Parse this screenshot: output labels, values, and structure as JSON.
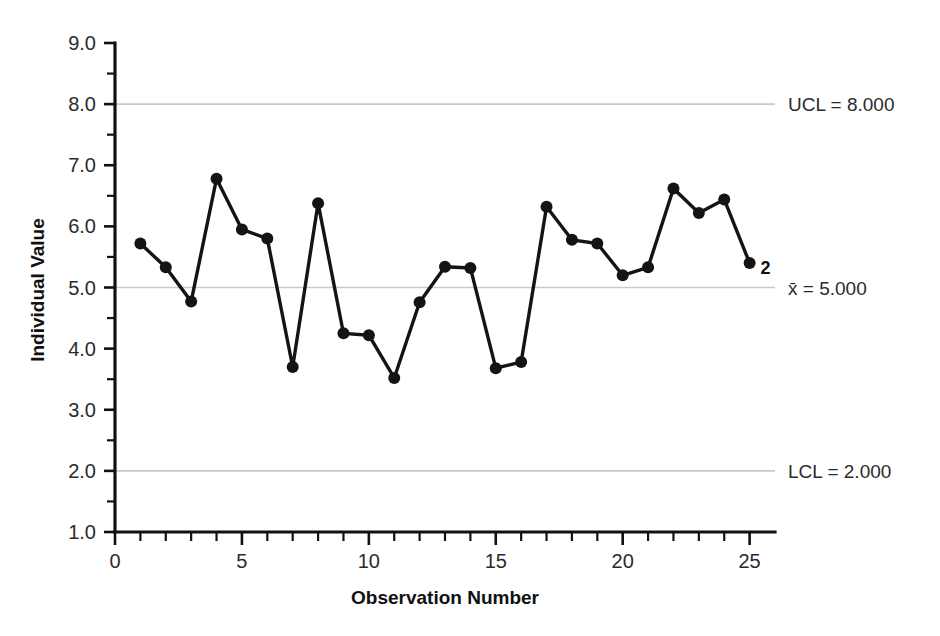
{
  "chart_data": {
    "type": "line",
    "title": "",
    "xlabel": "Observation Number",
    "ylabel": "Individual Value",
    "xlim": [
      0,
      26
    ],
    "ylim": [
      1.0,
      9.0
    ],
    "grid": true,
    "legend_position": "none",
    "x": [
      1,
      2,
      3,
      4,
      5,
      6,
      7,
      8,
      9,
      10,
      11,
      12,
      13,
      14,
      15,
      16,
      17,
      18,
      19,
      20,
      21,
      22,
      23,
      24,
      25
    ],
    "values": [
      5.72,
      5.33,
      4.77,
      6.78,
      5.95,
      5.8,
      3.7,
      6.38,
      4.25,
      4.22,
      3.52,
      4.76,
      5.34,
      5.32,
      3.68,
      3.78,
      6.32,
      5.78,
      5.72,
      5.2,
      5.33,
      6.62,
      6.22,
      6.44,
      5.4
    ],
    "series": [
      {
        "name": "Individual Value",
        "values": [
          5.72,
          5.33,
          4.77,
          6.78,
          5.95,
          5.8,
          3.7,
          6.38,
          4.25,
          4.22,
          3.52,
          4.76,
          5.34,
          5.32,
          3.68,
          3.78,
          6.32,
          5.78,
          5.72,
          5.2,
          5.33,
          6.62,
          6.22,
          6.44,
          5.4
        ]
      }
    ],
    "xticks": [
      0,
      5,
      10,
      15,
      20,
      25
    ],
    "xtick_labels": [
      "0",
      "5",
      "10",
      "15",
      "20",
      "25"
    ],
    "xtick_minor_step": 1,
    "yticks": [
      1.0,
      2.0,
      3.0,
      4.0,
      5.0,
      6.0,
      7.0,
      8.0,
      9.0
    ],
    "ytick_labels": [
      "1.0",
      "2.0",
      "3.0",
      "4.0",
      "5.0",
      "6.0",
      "7.0",
      "8.0",
      "9.0"
    ],
    "ytick_minor_step": 0.5,
    "control_limits": [
      {
        "id": "ucl",
        "label": "UCL = 8.000",
        "value": 8.0
      },
      {
        "id": "center",
        "label": "x̄ = 5.000",
        "value": 5.0
      },
      {
        "id": "lcl",
        "label": "LCL = 2.000",
        "value": 2.0
      }
    ],
    "annotations": [
      {
        "id": "violation-2",
        "text": "2",
        "x": 25,
        "y": 5.4
      }
    ],
    "colors": {
      "series": "#141414",
      "gridline": "#c9c9c9",
      "axis": "#111111",
      "text": "#2b2b2b"
    }
  }
}
